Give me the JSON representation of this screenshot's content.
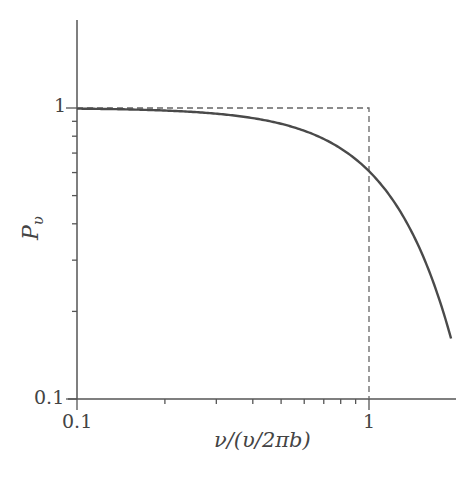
{
  "chart_data": {
    "type": "line",
    "title": "",
    "xlabel": "ν/(υ/2πb)",
    "ylabel": "P_υ",
    "xscale": "log",
    "yscale": "log",
    "xlim": [
      0.1,
      2.0
    ],
    "ylim": [
      0.1,
      2.0
    ],
    "x_tick_labels": [
      "0.1",
      "1"
    ],
    "y_tick_labels": [
      "0.1",
      "1"
    ],
    "grid": false,
    "legend": null,
    "series": [
      {
        "name": "P_υ (solid curve)",
        "style": "solid",
        "x": [
          0.1,
          0.2,
          0.3,
          0.4,
          0.5,
          0.6,
          0.7,
          0.8,
          0.9,
          1.0,
          1.2,
          1.4,
          1.6,
          1.8,
          1.91
        ],
        "y": [
          0.995,
          0.98,
          0.956,
          0.923,
          0.882,
          0.835,
          0.783,
          0.726,
          0.667,
          0.607,
          0.487,
          0.375,
          0.278,
          0.198,
          0.161
        ]
      },
      {
        "name": "step cutoff (dashed)",
        "style": "dashed",
        "x": [
          0.1,
          1.0,
          1.0
        ],
        "y": [
          1.0,
          1.0,
          0.1
        ]
      }
    ]
  },
  "labels": {
    "x_tick_01": "0.1",
    "x_tick_1": "1",
    "y_tick_01": "0.1",
    "y_tick_1": "1",
    "xlabel": "ν/(υ/2πb)",
    "ylabel_main": "P",
    "ylabel_sub": "υ"
  }
}
